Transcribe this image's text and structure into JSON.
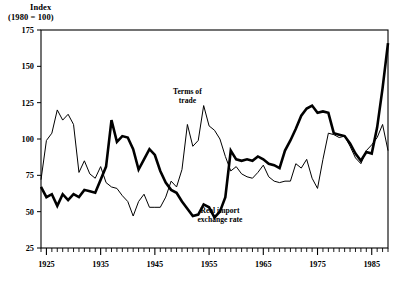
{
  "chart_data": {
    "type": "line",
    "title": "",
    "ylabel": "Index (1980 = 100)",
    "ylabel_line1": "Index",
    "ylabel_line2": "(1980 = 100)",
    "xlabel": "",
    "ylim": [
      25,
      175
    ],
    "xlim": [
      1924,
      1988
    ],
    "yticks": [
      25,
      50,
      75,
      100,
      125,
      150,
      175
    ],
    "xticks": [
      1925,
      1935,
      1945,
      1955,
      1965,
      1975,
      1985
    ],
    "xtick_labels": [
      "1925",
      "1935",
      "1945",
      "1955",
      "1965",
      "1975",
      "1985"
    ],
    "ytick_labels": [
      "25",
      "50",
      "75",
      "100",
      "125",
      "150",
      "175"
    ],
    "minor_xtick_interval": 1,
    "grid": false,
    "legend_position": "inline-annotations",
    "frame": "box",
    "annotations": [
      {
        "name": "terms-of-trade-label",
        "text_line1": "Terms of",
        "text_line2": "trade",
        "x": 1951,
        "y": 131
      },
      {
        "name": "real-import-exchange-rate-label",
        "text_line1": "Real import",
        "text_line2": "exchange rate",
        "x": 1957,
        "y": 49
      }
    ],
    "x": [
      1924,
      1925,
      1926,
      1927,
      1928,
      1929,
      1930,
      1931,
      1932,
      1933,
      1934,
      1935,
      1936,
      1937,
      1938,
      1939,
      1940,
      1941,
      1942,
      1943,
      1944,
      1945,
      1946,
      1947,
      1948,
      1949,
      1950,
      1951,
      1952,
      1953,
      1954,
      1955,
      1956,
      1957,
      1958,
      1959,
      1960,
      1961,
      1962,
      1963,
      1964,
      1965,
      1966,
      1967,
      1968,
      1969,
      1970,
      1971,
      1972,
      1973,
      1974,
      1975,
      1976,
      1977,
      1978,
      1979,
      1980,
      1981,
      1982,
      1983,
      1984,
      1985,
      1986,
      1987,
      1988
    ],
    "series": [
      {
        "name": "Terms of trade",
        "style": "thin",
        "color": "#000000",
        "linewidth": 1,
        "values": [
          72,
          99,
          104,
          120,
          113,
          117,
          110,
          77,
          85,
          76,
          73,
          81,
          70,
          67,
          66,
          61,
          57,
          47,
          57,
          62,
          53,
          53,
          53,
          60,
          71,
          67,
          79,
          110,
          95,
          99,
          123,
          109,
          106,
          100,
          88,
          78,
          81,
          76,
          74,
          73,
          77,
          82,
          74,
          71,
          70,
          71,
          71,
          83,
          80,
          86,
          73,
          66,
          86,
          104,
          103,
          101,
          102,
          95,
          87,
          83,
          92,
          96,
          101,
          110,
          92
        ]
      },
      {
        "name": "Real import exchange rate",
        "style": "thick",
        "color": "#000000",
        "linewidth": 2.6,
        "values": [
          67,
          60,
          62,
          54,
          62,
          58,
          62,
          60,
          65,
          64,
          63,
          72,
          81,
          113,
          98,
          102,
          101,
          93,
          79,
          86,
          93,
          89,
          78,
          70,
          65,
          63,
          57,
          52,
          47,
          48,
          55,
          53,
          46,
          50,
          60,
          92,
          86,
          85,
          86,
          85,
          88,
          86,
          83,
          82,
          80,
          92,
          99,
          107,
          116,
          121,
          123,
          118,
          119,
          118,
          104,
          103,
          102,
          97,
          90,
          85,
          91,
          90,
          108,
          135,
          166
        ]
      }
    ]
  }
}
